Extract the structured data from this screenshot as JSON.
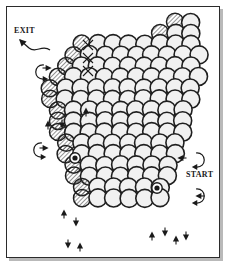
{
  "diagram": {
    "type": "hexagonal circle-packing maze",
    "labels": {
      "exit": "EXIT",
      "start": "START"
    },
    "colors": {
      "ink": "#1a1a1a",
      "circle_stroke": "#1f1f1f",
      "circle_fill": "#ffffff",
      "shaded_fill": "#f1f1f1",
      "frame_stroke": "#2b2b2b",
      "frame_shadow": "#b9b9b9",
      "page_background": "#ffffff"
    },
    "geometry": {
      "circle_radius": 9.0,
      "row_spacing": 13.6,
      "col_spacing": 15.6,
      "grid_rows": 17,
      "frame": {
        "x": 6,
        "y": 6,
        "width": 214,
        "height": 252
      }
    },
    "rows": [
      {
        "index": 0,
        "cx_start": 175.0,
        "cy": 22.0,
        "count": 2
      },
      {
        "index": 1,
        "cx_start": 160.0,
        "cy": 33.0,
        "count": 3
      },
      {
        "index": 2,
        "cx_start": 82.0,
        "cy": 44.0,
        "count": 8
      },
      {
        "index": 3,
        "cx_start": 74.0,
        "cy": 55.0,
        "count": 9
      },
      {
        "index": 4,
        "cx_start": 66.0,
        "cy": 66.0,
        "count": 9
      },
      {
        "index": 5,
        "cx_start": 58.0,
        "cy": 77.0,
        "count": 10
      },
      {
        "index": 6,
        "cx_start": 50.0,
        "cy": 88.0,
        "count": 10
      },
      {
        "index": 7,
        "cx_start": 50.0,
        "cy": 99.0,
        "count": 10
      },
      {
        "index": 8,
        "cx_start": 58.0,
        "cy": 110.0,
        "count": 9
      },
      {
        "index": 9,
        "cx_start": 58.0,
        "cy": 121.0,
        "count": 9
      },
      {
        "index": 10,
        "cx_start": 58.0,
        "cy": 132.0,
        "count": 9
      },
      {
        "index": 11,
        "cx_start": 66.0,
        "cy": 143.0,
        "count": 8
      },
      {
        "index": 12,
        "cx_start": 66.0,
        "cy": 154.0,
        "count": 8
      },
      {
        "index": 13,
        "cx_start": 74.0,
        "cy": 165.0,
        "count": 7
      },
      {
        "index": 14,
        "cx_start": 74.0,
        "cy": 176.0,
        "count": 7
      },
      {
        "index": 15,
        "cx_start": 82.0,
        "cy": 187.0,
        "count": 6
      },
      {
        "index": 16,
        "cx_start": 82.0,
        "cy": 198.0,
        "count": 6
      }
    ],
    "marked_cells": {
      "description": "circles bearing an X mark",
      "points": [
        {
          "x": 88.0,
          "y": 45.0
        },
        {
          "x": 88.0,
          "y": 58.0
        },
        {
          "x": 88.0,
          "y": 71.0
        }
      ]
    },
    "node_markers": {
      "description": "filled dot markers inside circles",
      "points": [
        {
          "x": 75.0,
          "y": 158.0
        },
        {
          "x": 157.0,
          "y": 188.0
        }
      ]
    },
    "arrows": {
      "description": "small solid direction arrows and curved connector arrows around the perimeter",
      "straight": [
        {
          "x": 47.0,
          "y": 68.0,
          "dir": "right"
        },
        {
          "x": 48.0,
          "y": 125.0,
          "dir": "up"
        },
        {
          "x": 44.0,
          "y": 148.0,
          "dir": "right"
        },
        {
          "x": 62.0,
          "y": 124.0,
          "dir": "down"
        },
        {
          "x": 64.0,
          "y": 214.0,
          "dir": "up"
        },
        {
          "x": 76.0,
          "y": 222.0,
          "dir": "down"
        },
        {
          "x": 80.0,
          "y": 247.0,
          "dir": "up"
        },
        {
          "x": 68.0,
          "y": 244.0,
          "dir": "down"
        },
        {
          "x": 86.0,
          "y": 112.0,
          "dir": "up"
        },
        {
          "x": 152.0,
          "y": 236.0,
          "dir": "up"
        },
        {
          "x": 165.0,
          "y": 232.0,
          "dir": "down"
        },
        {
          "x": 176.0,
          "y": 240.0,
          "dir": "up"
        },
        {
          "x": 186.0,
          "y": 236.0,
          "dir": "down"
        },
        {
          "x": 182.0,
          "y": 158.0,
          "dir": "left"
        },
        {
          "x": 200.0,
          "y": 196.0,
          "dir": "left"
        }
      ],
      "curved": [
        {
          "x": 44.0,
          "y": 72.0,
          "style": "loop-left"
        },
        {
          "x": 42.0,
          "y": 150.0,
          "style": "loop-left"
        },
        {
          "x": 196.0,
          "y": 160.0,
          "style": "loop-right"
        },
        {
          "x": 196.0,
          "y": 196.0,
          "style": "loop-right"
        }
      ]
    },
    "exit_arrow": {
      "x": 20.0,
      "y": 40.0,
      "dir": "up-left"
    }
  }
}
